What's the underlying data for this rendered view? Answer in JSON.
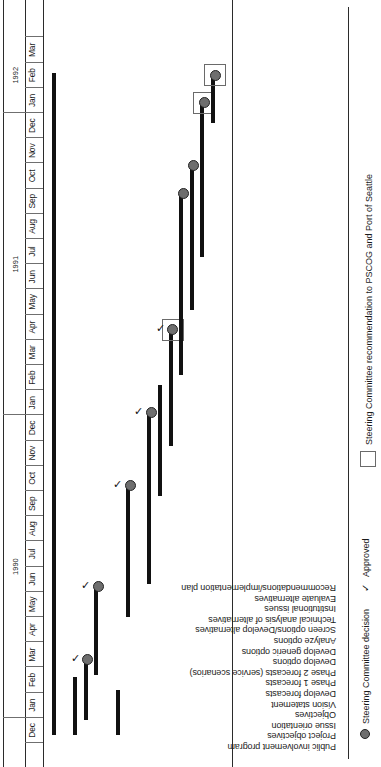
{
  "chart_data": {
    "type": "bar",
    "title": "",
    "xlabel": "",
    "ylabel": "",
    "orientation": "gantt-horizontal-rotated",
    "axis": {
      "months": [
        "Dec",
        "Jan",
        "Feb",
        "Mar",
        "Apr",
        "May",
        "Jun",
        "Jul",
        "Aug",
        "Sep",
        "Oct",
        "Nov",
        "Dec",
        "Jan",
        "Feb",
        "Mar",
        "Apr",
        "May",
        "Jun",
        "Jul",
        "Aug",
        "Sep",
        "Oct",
        "Nov",
        "Dec",
        "Jan",
        "Feb",
        "Mar"
      ],
      "years": [
        {
          "label": "1990",
          "month_index": 1
        },
        {
          "label": "1991",
          "month_index": 13
        },
        {
          "label": "1992",
          "month_index": 25
        }
      ],
      "start": "Dec 1989",
      "end": "Mar 1992"
    },
    "categories": [
      "Public involvement program",
      "Project objectives",
      "Issue orientation",
      "Objectives",
      "Vision statement",
      "Develop forecasts",
      "Phase 1 forecasts",
      "Phase 2 forecasts (service scenarios)",
      "Develop options",
      "Develop generic options",
      "Analyze options",
      "Screen options/Develop alternatives",
      "Technical analysis of alternatives",
      "Institutional issues",
      "Evaluate alternatives",
      "Recommendations/implementation plan"
    ],
    "tasks": [
      {
        "name": "Public involvement program",
        "row": 0,
        "is_header": false,
        "start_month": 0.3,
        "end_month": 26.6,
        "milestone": null,
        "approved": false,
        "recommendation_box": false
      },
      {
        "name": "Project objectives",
        "row": 1,
        "is_header": true,
        "start_month": null,
        "end_month": null,
        "milestone": null,
        "approved": false,
        "recommendation_box": false
      },
      {
        "name": "Issue orientation",
        "row": 2,
        "is_header": false,
        "start_month": 0.3,
        "end_month": 2.6,
        "milestone": null,
        "approved": false,
        "recommendation_box": false
      },
      {
        "name": "Objectives",
        "row": 3,
        "is_header": false,
        "start_month": 0.9,
        "end_month": 3.3,
        "milestone": 3.3,
        "approved": true,
        "recommendation_box": false
      },
      {
        "name": "Vision statement",
        "row": 4,
        "is_header": false,
        "start_month": 2.7,
        "end_month": 6.2,
        "milestone": 6.2,
        "approved": true,
        "recommendation_box": false
      },
      {
        "name": "Develop forecasts",
        "row": 5,
        "is_header": true,
        "start_month": null,
        "end_month": null,
        "milestone": null,
        "approved": false,
        "recommendation_box": false
      },
      {
        "name": "Phase 1 forecasts",
        "row": 6,
        "is_header": false,
        "start_month": 0.3,
        "end_month": 2.1,
        "milestone": null,
        "approved": false,
        "recommendation_box": false
      },
      {
        "name": "Phase 2 forecasts (service scenarios)",
        "row": 7,
        "is_header": false,
        "start_month": 5.0,
        "end_month": 10.2,
        "milestone": 10.2,
        "approved": true,
        "recommendation_box": false
      },
      {
        "name": "Develop options",
        "row": 8,
        "is_header": true,
        "start_month": null,
        "end_month": null,
        "milestone": null,
        "approved": false,
        "recommendation_box": false
      },
      {
        "name": "Develop generic options",
        "row": 9,
        "is_header": false,
        "start_month": 6.3,
        "end_month": 13.1,
        "milestone": 13.1,
        "approved": true,
        "recommendation_box": false
      },
      {
        "name": "Analyze options",
        "row": 10,
        "is_header": false,
        "start_month": 9.8,
        "end_month": 14.2,
        "milestone": null,
        "approved": false,
        "recommendation_box": false
      },
      {
        "name": "Screen options/Develop alternatives",
        "row": 11,
        "is_header": false,
        "start_month": 11.8,
        "end_month": 16.4,
        "milestone": 16.4,
        "approved": true,
        "recommendation_box": true
      },
      {
        "name": "Technical analysis of alternatives",
        "row": 12,
        "is_header": false,
        "start_month": 14.6,
        "end_month": 21.8,
        "milestone": 21.8,
        "approved": false,
        "recommendation_box": false
      },
      {
        "name": "Institutional issues",
        "row": 13,
        "is_header": false,
        "start_month": 17.2,
        "end_month": 22.9,
        "milestone": 22.9,
        "approved": false,
        "recommendation_box": false
      },
      {
        "name": "Evaluate alternatives",
        "row": 14,
        "is_header": false,
        "start_month": 19.3,
        "end_month": 25.4,
        "milestone": 25.4,
        "approved": false,
        "recommendation_box": true
      },
      {
        "name": "Recommendations/implementation plan",
        "row": 15,
        "is_header": false,
        "start_month": 24.6,
        "end_month": 26.5,
        "milestone": 26.5,
        "approved": false,
        "recommendation_box": true
      }
    ],
    "legend": [
      {
        "symbol": "dot",
        "label": "Steering Committee decision"
      },
      {
        "symbol": "check",
        "label": "Approved"
      },
      {
        "symbol": "box",
        "label": "Steering Committee recommendation to PSCOG and Port of Seattle"
      }
    ],
    "colors": {
      "bar": "#111111",
      "milestone_fill": "#6e6e6e",
      "milestone_stroke": "#232323",
      "axis": "#2b2b2b",
      "box_stroke": "#6a6a6a",
      "text": "#1a1a1a",
      "background": "#ffffff"
    },
    "glyphs": {
      "check": "✓"
    }
  }
}
